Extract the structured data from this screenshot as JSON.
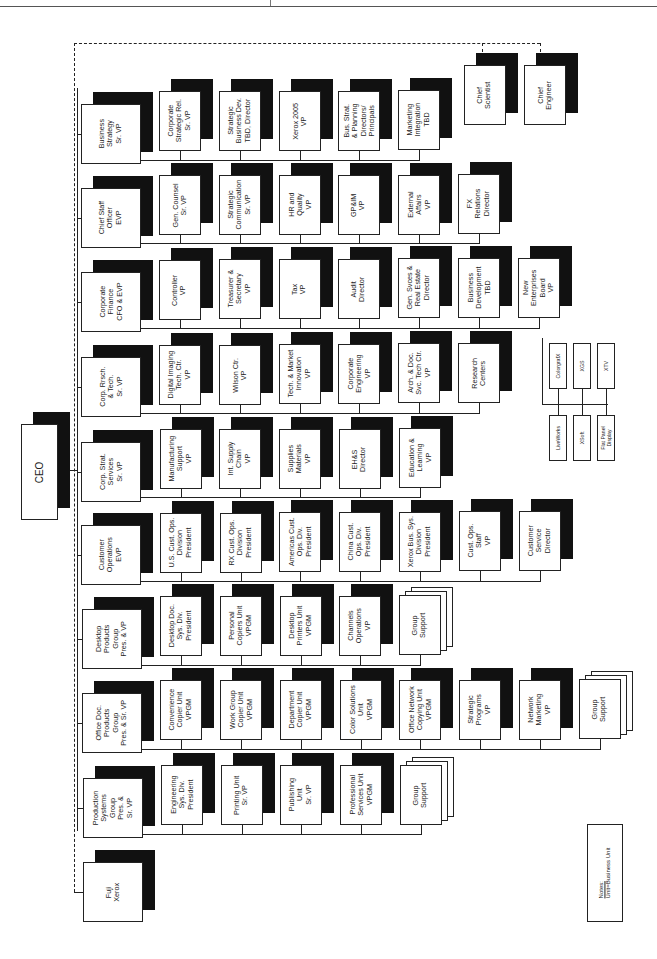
{
  "ceo": {
    "label": "CEO",
    "box": [
      21,
      424,
      37,
      96
    ],
    "shadow": [
      33,
      412,
      37,
      96
    ]
  },
  "trunk": {
    "x": 77,
    "y1": 88,
    "y2": 830
  },
  "ceo_link": {
    "x1": 58,
    "x2": 77,
    "y": 470
  },
  "dashed": {
    "top_y": 43,
    "left_x": 74,
    "right_x": 540,
    "bottom_y": 892,
    "drops": [
      {
        "x": 482,
        "y2": 52
      },
      {
        "x": 540,
        "y2": 52
      }
    ]
  },
  "rows": [
    {
      "id": "business-strategy",
      "head": {
        "label": "Business\nStrategy\nSr. VP",
        "x": 81,
        "y": 104,
        "w": 60,
        "h": 60
      },
      "bus_y": 160,
      "children": [
        {
          "label": "Corporate\nStrategic Rel.\nSr. VP",
          "x": 159,
          "y": 91
        },
        {
          "label": "Strategic\nBusiness Dev.\nTBD, Director",
          "x": 219,
          "y": 91
        },
        {
          "label": "Xerox 2005\nVP",
          "x": 279,
          "y": 91
        },
        {
          "label": "Bus. Strat.\n& Planning\nDirectors/\nPrincipals",
          "x": 338,
          "y": 91
        },
        {
          "label": "Marketing\nIntegration\nTBD",
          "x": 398,
          "y": 90
        }
      ]
    },
    {
      "id": "chief-staff",
      "head": {
        "label": "Chief Staff\nOfficer\nEVP",
        "x": 81,
        "y": 188,
        "w": 60,
        "h": 60
      },
      "bus_y": 243,
      "children": [
        {
          "label": "Gen. Counsel\nSr. VP",
          "x": 159,
          "y": 175
        },
        {
          "label": "Strategic\nCommunication\nSr. VP",
          "x": 219,
          "y": 175
        },
        {
          "label": "HR and\nQuality\nVP",
          "x": 279,
          "y": 175
        },
        {
          "label": "GP&IM\nVP",
          "x": 338,
          "y": 175
        },
        {
          "label": "External\nAffairs\nVP",
          "x": 398,
          "y": 175
        },
        {
          "label": "FX\nRelations\nDirector",
          "x": 458,
          "y": 174
        }
      ]
    },
    {
      "id": "corporate-finance",
      "head": {
        "label": "Corporate\nFinance\nCFO & EVP",
        "x": 81,
        "y": 272,
        "w": 60,
        "h": 60
      },
      "bus_y": 328,
      "children": [
        {
          "label": "Controller\nVP",
          "x": 159,
          "y": 260
        },
        {
          "label": "Treasurer &\nSecretary\nVP",
          "x": 219,
          "y": 259
        },
        {
          "label": "Tax\nVP",
          "x": 279,
          "y": 259
        },
        {
          "label": "Audit\nDirector",
          "x": 338,
          "y": 259
        },
        {
          "label": "Gen. Svces &\nReal Estate\nDirector",
          "x": 398,
          "y": 258
        },
        {
          "label": "Business\nDevelopment\nTBD",
          "x": 458,
          "y": 258
        },
        {
          "label": "New\nEnterprises\nBoard\nVP",
          "x": 518,
          "y": 258
        }
      ]
    },
    {
      "id": "corp-research",
      "head": {
        "label": "Corp. Rrsch.\n& Tech.\nSr. VP",
        "x": 81,
        "y": 357,
        "w": 60,
        "h": 60
      },
      "bus_y": 413,
      "children": [
        {
          "label": "Digital Imaging\nTech. Ctr.\nVP",
          "x": 159,
          "y": 345
        },
        {
          "label": "Wilson Ctr.\nVP",
          "x": 219,
          "y": 345
        },
        {
          "label": "Tech. & Market\nInnovation\nVP",
          "x": 279,
          "y": 344
        },
        {
          "label": "Corporate\nEngineering\nVP",
          "x": 338,
          "y": 344
        },
        {
          "label": "Arch. & Doc.\nSvc. Tech Ctr.\nVP",
          "x": 398,
          "y": 343
        },
        {
          "label": "Research\nCenters",
          "x": 458,
          "y": 343
        }
      ]
    },
    {
      "id": "corp-strat-services",
      "head": {
        "label": "Corp. Strat.\nServices\nSr. VP",
        "x": 81,
        "y": 442,
        "w": 60,
        "h": 60
      },
      "bus_y": 497,
      "children": [
        {
          "label": "Manufacturing\nSupport\nVP",
          "x": 160,
          "y": 429
        },
        {
          "label": "Int. Supply\nChain\nVP",
          "x": 219,
          "y": 429
        },
        {
          "label": "Supplies\nMaterials\nVP",
          "x": 279,
          "y": 429
        },
        {
          "label": "EH&S\nDirector",
          "x": 339,
          "y": 429
        },
        {
          "label": "Education &\nLearning\nVP",
          "x": 399,
          "y": 428
        }
      ]
    },
    {
      "id": "customer-operations",
      "head": {
        "label": "Customer\nOperations\nEVP",
        "x": 81,
        "y": 525,
        "w": 60,
        "h": 60
      },
      "bus_y": 581,
      "children": [
        {
          "label": "U.S. Cust. Ops.\nDivision\nPresident",
          "x": 160,
          "y": 513
        },
        {
          "label": "RX Cust. Ops.\nDivision\nPresident",
          "x": 220,
          "y": 513
        },
        {
          "label": "Americas Cust.\nOps. Div.\nPresident",
          "x": 279,
          "y": 512
        },
        {
          "label": "China Cust.\nOps. Div.\nPresident",
          "x": 339,
          "y": 512
        },
        {
          "label": "Xerox Bus. Sys.\nDivision\nPresident",
          "x": 399,
          "y": 512
        },
        {
          "label": "Cust. Ops.\nStaff\nVP",
          "x": 459,
          "y": 511
        },
        {
          "label": "Customer\nService\nDirector",
          "x": 519,
          "y": 511
        }
      ]
    },
    {
      "id": "desktop-products",
      "head": {
        "label": "Desktop\nProducts\nGroup\nPres. & VP",
        "x": 82,
        "y": 609,
        "w": 60,
        "h": 60
      },
      "bus_y": 665,
      "children": [
        {
          "label": "Desktop Doc.\nSys. Div.\nPresident",
          "x": 160,
          "y": 596
        },
        {
          "label": "Personal\nCopiers Unit\nVPGM",
          "x": 220,
          "y": 596
        },
        {
          "label": "Desktop\nPrinters Unit\nVPGM",
          "x": 280,
          "y": 596
        },
        {
          "label": "Channels\nOperations\nVP",
          "x": 339,
          "y": 596
        },
        {
          "label": "Group\nSupport",
          "x": 399,
          "y": 595,
          "stack": true
        }
      ]
    },
    {
      "id": "office-doc-products",
      "head": {
        "label": "Office Doc.\nProducts\nGroup\nPres. & Sr. VP",
        "x": 82,
        "y": 693,
        "w": 60,
        "h": 60
      },
      "bus_y": 749,
      "children": [
        {
          "label": "Convenience\nCopier Unit\nVPGM",
          "x": 160,
          "y": 680
        },
        {
          "label": "Work Group\nCopier Unit\nVPGM",
          "x": 220,
          "y": 680
        },
        {
          "label": "Department\nCopier Unit\nVPGM",
          "x": 280,
          "y": 680
        },
        {
          "label": "Color Solutions\nUnit\nVPGM",
          "x": 340,
          "y": 680
        },
        {
          "label": "Office Network\nCopying Unit\nVPGM",
          "x": 399,
          "y": 680
        },
        {
          "label": "Strategic\nPrograms\nVP",
          "x": 459,
          "y": 680
        },
        {
          "label": "Network\nMarketing\nVP",
          "x": 519,
          "y": 680
        },
        {
          "label": "Group\nSupport",
          "x": 579,
          "y": 679,
          "stack": true
        }
      ]
    },
    {
      "id": "production-systems",
      "head": {
        "label": "Production\nSystems\nGroup\nPres. &\nSr. VP",
        "x": 83,
        "y": 778,
        "w": 60,
        "h": 60
      },
      "bus_y": 834,
      "children": [
        {
          "label": "Engineering\nSys. Div.\nPresident",
          "x": 161,
          "y": 765
        },
        {
          "label": "Printing Unit\nSr. VP",
          "x": 221,
          "y": 765
        },
        {
          "label": "Publishing\nUnit\nSr. VP",
          "x": 280,
          "y": 765
        },
        {
          "label": "Professional\nServices Unit\nVPGM",
          "x": 340,
          "y": 765
        },
        {
          "label": "Group\nSupport",
          "x": 400,
          "y": 765,
          "stack": true
        }
      ]
    }
  ],
  "chiefs": [
    {
      "label": "Chief\nScientist",
      "x": 464,
      "y": 65
    },
    {
      "label": "Chief\nEngineer",
      "x": 524,
      "y": 65
    }
  ],
  "ventures": {
    "drop": {
      "x": 542,
      "y1": 338,
      "y2": 404
    },
    "bus_y": 404,
    "top": [
      {
        "label": "ColorgrafX",
        "x": 549,
        "y": 343
      },
      {
        "label": "XGS",
        "x": 573,
        "y": 343
      },
      {
        "label": "XTV",
        "x": 597,
        "y": 343
      }
    ],
    "bottom": [
      {
        "label": "LiveWorks",
        "x": 549,
        "y": 415
      },
      {
        "label": "XSoft",
        "x": 573,
        "y": 415
      },
      {
        "label": "Flat Panel\nDisplay",
        "x": 597,
        "y": 415
      }
    ]
  },
  "fuji": {
    "label": "Fuji\nXerox",
    "x": 83,
    "y": 862,
    "w": 60,
    "h": 60
  },
  "notes": {
    "heading": "Notes:",
    "text": "Unit=Business Unit",
    "x": 587,
    "y": 824,
    "w": 36,
    "h": 98
  }
}
